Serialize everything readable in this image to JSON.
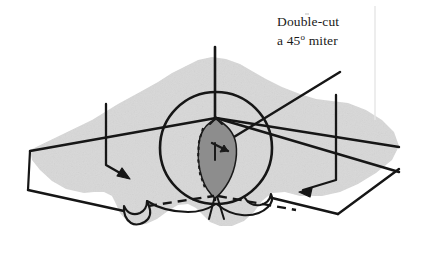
{
  "figure": {
    "caption_lines": [
      "Double-cut",
      "a 45"
    ],
    "caption_line1": "Double-cut",
    "caption_line2_pre": "a 45",
    "caption_degree_symbol": "o",
    "caption_line2_post": " miter",
    "colors": {
      "background": "#ffffff",
      "board_fill": "#d8d8d8",
      "board_stroke": "#161616",
      "kerf_fill": "#8d8d8d",
      "kerf_stroke": "#1a1a1a",
      "text": "#1a1a1a",
      "scan_artifact": "#e4e4e4"
    },
    "elements": {
      "board_label": "workpiece board with irregular grain edge",
      "circle_label": "saw blade circle",
      "kerf_label": "double-cut kerf wedge",
      "center_line_label": "vertical center layout line",
      "dashed_line_label": "hidden bottom cut line",
      "left_arrow_label": "left cut direction arrow",
      "right_arrow_label": "right cut direction arrow",
      "miter_line_left_label": "45 degree miter layout line going up-right",
      "miter_line_right_label": "45 degree miter layout line going down-right",
      "top_edge_label": "board top face edge",
      "bottom_edge_label": "board bottom face edge"
    },
    "geometry": {
      "blade_circle": {
        "cx": 216,
        "cy": 148,
        "r": 56
      },
      "center_line": {
        "x": 216,
        "y_top": 47,
        "y_bottom": 219
      },
      "left_arrow_tip": {
        "x": 129,
        "y": 179
      },
      "right_arrow_tip": {
        "x": 299,
        "y": 192
      }
    }
  }
}
